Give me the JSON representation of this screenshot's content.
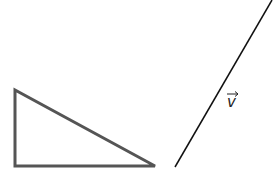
{
  "diagram": {
    "triangle": {
      "points": [
        [
          15,
          90
        ],
        [
          15,
          166
        ],
        [
          155,
          166
        ]
      ],
      "stroke": "#555555"
    },
    "vector": {
      "label": "v",
      "from": [
        175,
        167
      ],
      "to": [
        272,
        0
      ],
      "stroke": "#111111"
    }
  }
}
